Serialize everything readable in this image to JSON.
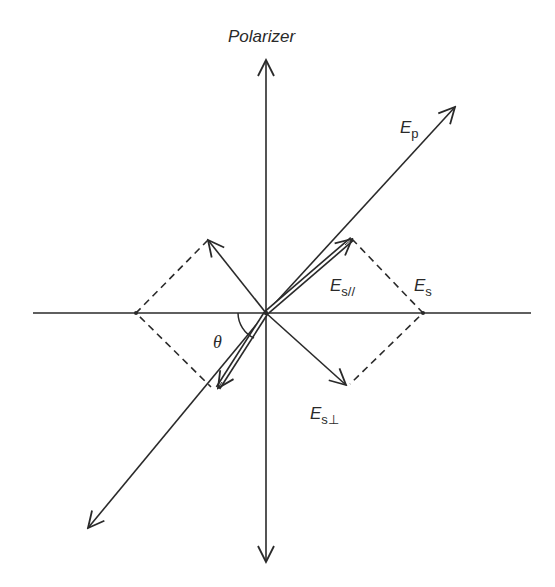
{
  "diagram": {
    "title_label": "Polarizer",
    "labels": {
      "ep": {
        "main": "E",
        "sub": "p"
      },
      "es_par": {
        "main": "E",
        "sub": "s//"
      },
      "es": {
        "main": "E",
        "sub": "s"
      },
      "es_perp": {
        "main": "E",
        "sub": "s⊥"
      },
      "theta": "θ"
    },
    "colors": {
      "line": "#2a2a2a",
      "background": "#ffffff"
    }
  }
}
